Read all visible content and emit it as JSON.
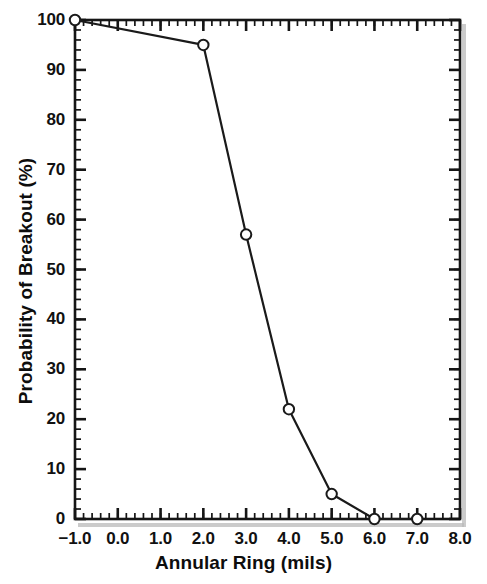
{
  "chart_data": {
    "type": "line",
    "title": "",
    "xlabel": "Annular Ring (mils)",
    "ylabel": "Probability of Breakout (%)",
    "xlim": [
      -1.0,
      8.0
    ],
    "ylim": [
      0,
      100
    ],
    "grid": false,
    "legend": null,
    "marker": "open-circle",
    "line_color": "#1a1a1a",
    "marker_fill": "#ffffff",
    "x": [
      -1.0,
      2.0,
      3.0,
      4.0,
      5.0,
      6.0,
      7.0
    ],
    "values": [
      100,
      95,
      57,
      22,
      5,
      0,
      0
    ],
    "points": [
      {
        "x": -1.0,
        "y": 100
      },
      {
        "x": 2.0,
        "y": 95
      },
      {
        "x": 3.0,
        "y": 57
      },
      {
        "x": 4.0,
        "y": 22
      },
      {
        "x": 5.0,
        "y": 5
      },
      {
        "x": 6.0,
        "y": 0
      },
      {
        "x": 7.0,
        "y": 0
      }
    ],
    "xticks": [
      -1.0,
      0.0,
      1.0,
      2.0,
      3.0,
      4.0,
      5.0,
      6.0,
      7.0,
      8.0
    ],
    "xticklabels": [
      "−1.0",
      "0.0",
      "1.0",
      "2.0",
      "3.0",
      "4.0",
      "5.0",
      "6.0",
      "7.0",
      "8.0"
    ],
    "yticks": [
      0,
      10,
      20,
      30,
      40,
      50,
      60,
      70,
      80,
      90,
      100
    ],
    "yticklabels": [
      "0",
      "10",
      "20",
      "30",
      "40",
      "50",
      "60",
      "70",
      "80",
      "90",
      "100"
    ],
    "x_minor_step": 0.2,
    "y_minor_step": 2
  },
  "axes": {
    "x_title": "Annular Ring (mils)",
    "y_title": "Probability of Breakout (%)"
  }
}
